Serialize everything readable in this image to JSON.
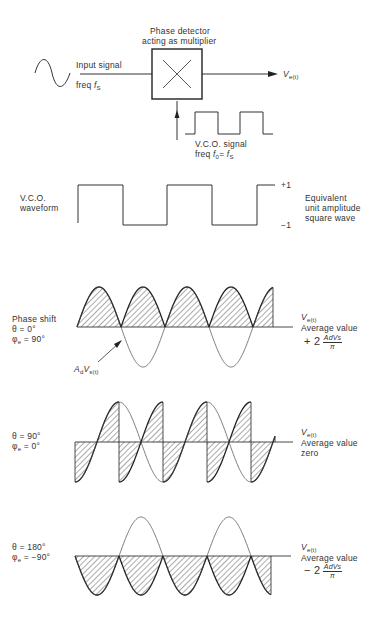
{
  "header": {
    "partial_title": "...g ... app..."
  },
  "block_diagram": {
    "detector_label_line1": "Phase detector",
    "detector_label_line2": "acting as multiplier",
    "multiplier_symbol": "multiply-x-icon",
    "input_label_line1": "Input signal",
    "input_label_line2_prefix": "freq ",
    "input_freq_symbol": "f",
    "input_freq_sub": "S",
    "output_symbol": "V",
    "output_sub": "e(t)",
    "vco_signal_line1": "V.C.O. signal",
    "vco_signal_line2_prefix": "freq  ",
    "vco_freq_symbol": "f",
    "vco_freq_sub": "0",
    "vco_freq_eq": "= ",
    "vco_freq_symbol2": "f",
    "vco_freq_sub2": "S"
  },
  "vco_waveform": {
    "label_line1": "V.C.O.",
    "label_line2": "waveform",
    "plus_level": "+1",
    "minus_level": "−1",
    "desc_line1": "Equivalent",
    "desc_line2": "unit amplitude",
    "desc_line3": "square wave"
  },
  "panels": [
    {
      "id": "theta-0",
      "title": "Phase shift",
      "theta": "θ = 0°",
      "phi": "φ",
      "phi_sub": "e",
      "phi_val": " = 90°",
      "annotation_symbol": "A",
      "annotation_sub1": "d",
      "annotation_symbol2": "V",
      "annotation_sub2": "s(t)",
      "out_symbol": "V",
      "out_sub": "e(t)",
      "avg_label": "Average value",
      "avg_sign": "+ 2",
      "avg_num": "AdVs",
      "avg_den": "π"
    },
    {
      "id": "theta-90",
      "theta": "θ = 90°",
      "phi": "φ",
      "phi_sub": "e",
      "phi_val": " = 0°",
      "out_symbol": "V",
      "out_sub": "e(t)",
      "avg_label": "Average value",
      "avg_value": "zero"
    },
    {
      "id": "theta-180",
      "theta": "θ = 180°",
      "phi": "φ",
      "phi_sub": "e",
      "phi_val": " = −90°",
      "out_symbol": "V",
      "out_sub": "e(t)",
      "avg_label": "Average value",
      "avg_sign": "− 2",
      "avg_num": "AdVs",
      "avg_den": "π"
    }
  ],
  "chart_data": {
    "type": "line",
    "x_range_px": [
      76,
      273
    ],
    "half_period_px": 44,
    "vco_square_wave": {
      "levels": [
        1,
        -1
      ],
      "transitions_px": [
        78,
        123,
        167,
        212,
        257,
        272
      ]
    },
    "series": [
      {
        "name": "theta = 0 deg (phi_e = 90 deg)",
        "input": "sin",
        "product": "|sin| rectified positive",
        "average": "+2 AdVs/pi"
      },
      {
        "name": "theta = 90 deg (phi_e = 0 deg)",
        "input": "-cos",
        "product": "alternating segments",
        "average": "0"
      },
      {
        "name": "theta = 180 deg (phi_e = -90 deg)",
        "input": "-sin",
        "product": "|sin| rectified negative",
        "average": "-2 AdVs/pi"
      }
    ],
    "colors": {
      "ink": "#2a2a2a",
      "hatch": "#444444",
      "background": "#ffffff"
    }
  }
}
